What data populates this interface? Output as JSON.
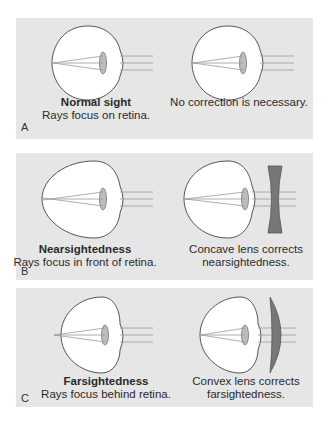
{
  "panels": {
    "a": {
      "label": "A",
      "left_title": "Normal sight",
      "left_desc": "Rays focus on retina.",
      "right_desc": "No correction is necessary."
    },
    "b": {
      "label": "B",
      "left_title": "Nearsightedness",
      "left_desc": "Rays focus in front of retina.",
      "right_line1": "Concave lens corrects",
      "right_line2": "nearsightedness."
    },
    "c": {
      "label": "C",
      "left_title": "Farsightedness",
      "left_desc": "Rays focus behind retina.",
      "right_line1": "Convex lens corrects",
      "right_line2": "farsightedness."
    }
  },
  "colors": {
    "panel_bg": "#e6e6e6",
    "eye_fill": "#ffffff",
    "outline": "#555555",
    "lens_fill": "#bdbdbd",
    "corrective_lens": "#777777",
    "ray": "#9a9a9a"
  }
}
